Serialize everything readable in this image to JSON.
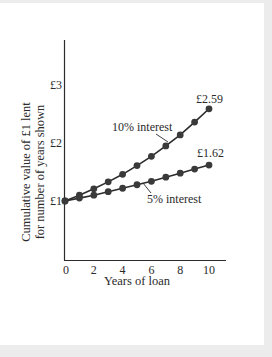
{
  "chart_data": {
    "type": "line",
    "title": "",
    "xlabel": "Years of loan",
    "ylabel_line1": "Cumulative value of £1 lent",
    "ylabel_line2": "for number of years shown",
    "x": [
      0,
      1,
      2,
      3,
      4,
      5,
      6,
      7,
      8,
      9,
      10
    ],
    "xticks": [
      "0",
      "2",
      "4",
      "6",
      "8",
      "10"
    ],
    "yticks": [
      "£1",
      "£2",
      "£3"
    ],
    "xlim": [
      0,
      11
    ],
    "ylim": [
      0,
      3.7
    ],
    "grid": false,
    "series": [
      {
        "name": "10% interest",
        "values": [
          1.0,
          1.1,
          1.21,
          1.33,
          1.46,
          1.61,
          1.77,
          1.95,
          2.14,
          2.36,
          2.59
        ],
        "end_label": "£2.59"
      },
      {
        "name": "5% interest",
        "values": [
          1.0,
          1.05,
          1.1,
          1.16,
          1.22,
          1.28,
          1.34,
          1.41,
          1.48,
          1.55,
          1.62
        ],
        "end_label": "£1.62"
      }
    ]
  },
  "colors": {
    "line": "#2b2b2b",
    "marker": "#3a3a3a",
    "background": "#ffffff",
    "frame": "#ececec"
  }
}
